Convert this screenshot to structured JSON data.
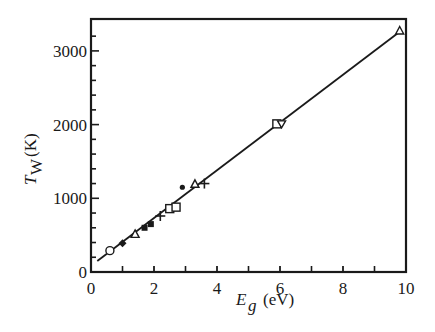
{
  "chart_data": {
    "type": "scatter",
    "title": "",
    "xlabel": "E_g (eV)",
    "xlabel_main": "E",
    "xlabel_sub": "g",
    "xlabel_unit": "(eV)",
    "ylabel": "T_W (K)",
    "ylabel_main": "T",
    "ylabel_sub": "W",
    "ylabel_unit": "(K)",
    "xlim": [
      0,
      10
    ],
    "ylim": [
      0,
      3350
    ],
    "xticks": [
      0,
      2,
      4,
      6,
      8,
      10
    ],
    "xtick_labels": [
      "0",
      "2",
      "4",
      "6",
      "8",
      "10"
    ],
    "xminor_ticks": [
      1,
      3,
      5,
      7,
      9
    ],
    "yticks": [
      0,
      1000,
      2000,
      3000
    ],
    "ytick_labels": [
      "0",
      "1000",
      "2000",
      "3000"
    ],
    "yminor_step": 200,
    "grid": false,
    "legend": null,
    "fit_line": {
      "x": [
        0.2,
        9.8
      ],
      "y": [
        150,
        3260
      ],
      "style": "solid"
    },
    "series": [
      {
        "name": "open-circle",
        "marker": "o-open",
        "x": [
          0.6
        ],
        "y": [
          290
        ]
      },
      {
        "name": "filled-diamond",
        "marker": "diamond-filled",
        "x": [
          1.0
        ],
        "y": [
          390
        ]
      },
      {
        "name": "open-triangle",
        "marker": "triangle-open",
        "x": [
          1.4,
          3.3,
          9.8
        ],
        "y": [
          510,
          1190,
          3270
        ]
      },
      {
        "name": "filled-square",
        "marker": "square-filled",
        "x": [
          1.7,
          1.9
        ],
        "y": [
          600,
          650
        ]
      },
      {
        "name": "plus",
        "marker": "plus",
        "x": [
          2.2,
          3.6
        ],
        "y": [
          760,
          1200
        ]
      },
      {
        "name": "open-square",
        "marker": "square-open",
        "x": [
          2.5,
          2.7
        ],
        "y": [
          860,
          880
        ]
      },
      {
        "name": "filled-dot",
        "marker": "dot",
        "x": [
          2.9
        ],
        "y": [
          1150
        ]
      },
      {
        "name": "open-square-2",
        "marker": "square-open",
        "x": [
          5.9
        ],
        "y": [
          2010
        ]
      },
      {
        "name": "open-inverted-triangle",
        "marker": "triangle-down-open",
        "x": [
          6.05
        ],
        "y": [
          2010
        ]
      }
    ]
  },
  "plot": {
    "px_left": 91,
    "px_right": 406,
    "px_top": 19,
    "px_bottom": 272,
    "px_per_x": 31.5,
    "px_per_y": 0.0737,
    "stroke_color": "#1a1a1a"
  }
}
